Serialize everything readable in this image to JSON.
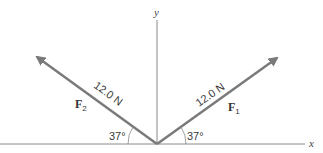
{
  "diagram": {
    "axes": {
      "x_label": "x",
      "y_label": "y"
    },
    "vectors": [
      {
        "name": "F",
        "subscript": "1",
        "magnitude_label": "12.0 N",
        "angle_label": "37°",
        "direction": "right-up"
      },
      {
        "name": "F",
        "subscript": "2",
        "magnitude_label": "12.0 N",
        "angle_label": "37°",
        "direction": "left-up"
      }
    ],
    "colors": {
      "vector": "#7a7a7a",
      "axis": "#8a8a8a",
      "text": "#3a3a3a"
    }
  }
}
